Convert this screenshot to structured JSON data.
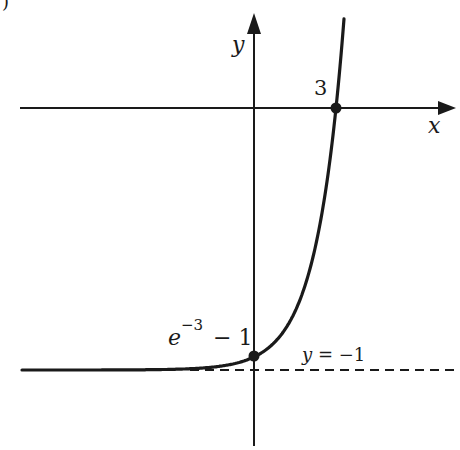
{
  "figure": {
    "corner_fragment": ")",
    "axes": {
      "x_label": "x",
      "y_label": "y"
    },
    "function": "y = e^(x-3) - 1",
    "points": [
      {
        "name": "x-intercept",
        "label": "3",
        "x": 3,
        "y": 0
      },
      {
        "name": "y-intercept",
        "label_base": "e",
        "label_exp": "−3",
        "label_rest": " − 1",
        "x": 0,
        "y": -0.9502
      }
    ],
    "asymptote": {
      "label": "y = −1",
      "label_var": "y",
      "label_eq": " = −1",
      "y": -1,
      "style": "dashed"
    },
    "colors": {
      "ink": "#1a1a1a",
      "background": "#ffffff"
    }
  }
}
